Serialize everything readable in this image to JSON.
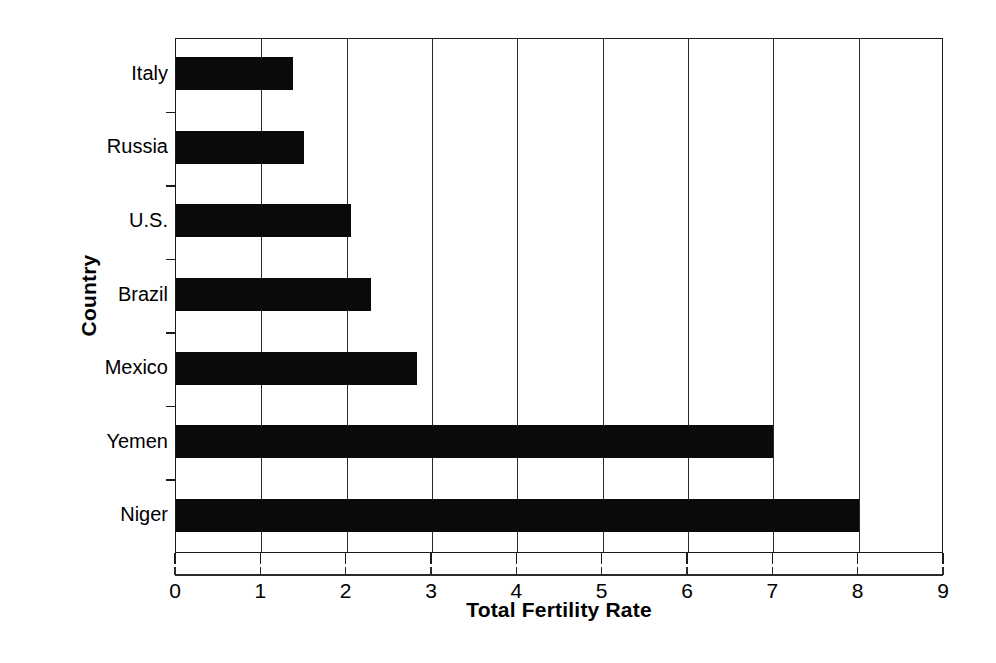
{
  "chart_data": {
    "type": "bar",
    "orientation": "horizontal",
    "title": "",
    "xlabel": "Total Fertility Rate",
    "ylabel": "Country",
    "categories": [
      "Italy",
      "Russia",
      "U.S.",
      "Brazil",
      "Mexico",
      "Yemen",
      "Niger"
    ],
    "values": [
      1.37,
      1.5,
      2.05,
      2.28,
      2.82,
      7.0,
      8.0
    ],
    "xlim": [
      0,
      9
    ],
    "xticks": [
      "0",
      "1",
      "2",
      "3",
      "4",
      "5",
      "6",
      "7",
      "8",
      "9"
    ],
    "xtick_values": [
      0,
      1,
      2,
      3,
      4,
      5,
      6,
      7,
      8,
      9
    ],
    "grid": "vertical",
    "legend": "none",
    "bar_color": "#0a0a0a",
    "frame_color": "#1a1a1a",
    "background_color": "#ffffff"
  }
}
